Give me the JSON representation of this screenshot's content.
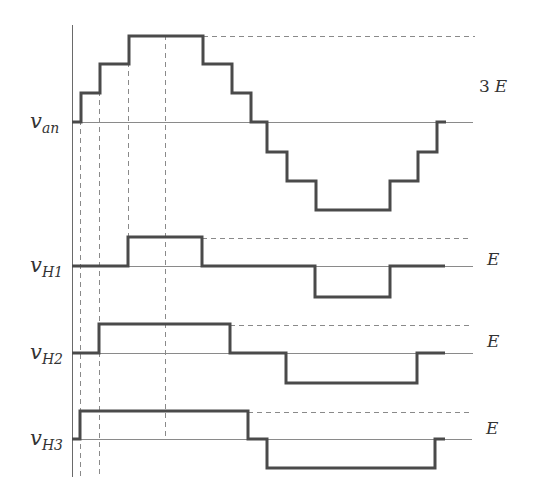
{
  "diagram": {
    "title": "",
    "colors": {
      "waveform": "#4a4a4a",
      "reference": "#8a8a8a",
      "text": "#333333"
    },
    "traces": [
      {
        "id": "v_an",
        "label_main": "v",
        "label_sub": "an",
        "amplitude_label_num": "3",
        "amplitude_label_var": "E",
        "levels": [
          0,
          1,
          2,
          3,
          2,
          1,
          0,
          -1,
          -2,
          -3,
          -2,
          -1,
          0
        ]
      },
      {
        "id": "v_H1",
        "label_main": "v",
        "label_sub": "H1",
        "amplitude_label_num": "",
        "amplitude_label_var": "E",
        "levels": [
          0,
          1,
          0,
          -1,
          0
        ]
      },
      {
        "id": "v_H2",
        "label_main": "v",
        "label_sub": "H2",
        "amplitude_label_num": "",
        "amplitude_label_var": "E",
        "levels": [
          0,
          1,
          0,
          -1,
          0
        ]
      },
      {
        "id": "v_H3",
        "label_main": "v",
        "label_sub": "H3",
        "amplitude_label_num": "",
        "amplitude_label_var": "E",
        "levels": [
          0,
          1,
          0,
          -1,
          0
        ]
      }
    ]
  }
}
